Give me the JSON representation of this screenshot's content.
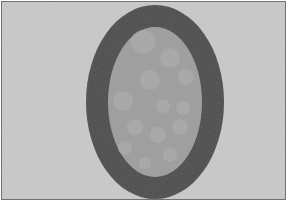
{
  "image": {
    "description": "Grayscale photograph of a dark elliptical ring with a lighter gray interior containing faint circular spots",
    "colors": {
      "frame_border": "#6a6a6a",
      "background": "#c9c9c9",
      "ring": "#4a4a4a",
      "interior": "#9e9e9e",
      "spot": "#adadad",
      "bottom_margin": "#ffffff"
    },
    "outer_ellipse": {
      "cx": 155,
      "cy": 102,
      "rx": 69,
      "ry": 97
    },
    "inner_ellipse": {
      "cx": 155,
      "cy": 102,
      "rx": 47,
      "ry": 75
    },
    "spots": [
      {
        "cx": 143,
        "cy": 42,
        "r": 12
      },
      {
        "cx": 170,
        "cy": 58,
        "r": 10
      },
      {
        "cx": 150,
        "cy": 80,
        "r": 10
      },
      {
        "cx": 186,
        "cy": 77,
        "r": 8
      },
      {
        "cx": 123,
        "cy": 101,
        "r": 10
      },
      {
        "cx": 163,
        "cy": 106,
        "r": 7
      },
      {
        "cx": 183,
        "cy": 108,
        "r": 7
      },
      {
        "cx": 135,
        "cy": 127,
        "r": 8
      },
      {
        "cx": 180,
        "cy": 127,
        "r": 8
      },
      {
        "cx": 158,
        "cy": 135,
        "r": 8
      },
      {
        "cx": 125,
        "cy": 148,
        "r": 7
      },
      {
        "cx": 170,
        "cy": 155,
        "r": 7
      },
      {
        "cx": 145,
        "cy": 163,
        "r": 6
      }
    ],
    "caption": "Elliptical ring with spotted interior"
  }
}
